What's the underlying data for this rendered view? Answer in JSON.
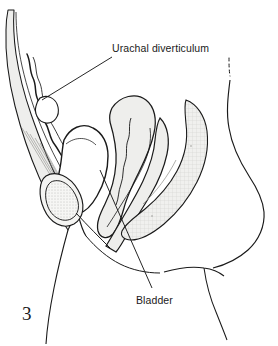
{
  "figure": {
    "number": "3",
    "kind": "medical-line-illustration",
    "view": "sagittal-section-female-pelvis",
    "background_color": "#ffffff",
    "ink_color": "#1a1a1a",
    "tissue_fill_color": "#eeeeec",
    "hatch_fill_color": "#e6e6e4"
  },
  "labels": [
    {
      "id": "urachal",
      "text": "Urachal diverticulum",
      "leader": {
        "from_x": 112,
        "from_y": 57,
        "to_x": 42,
        "to_y": 100
      }
    },
    {
      "id": "bladder",
      "text": "Bladder",
      "leader": {
        "from_x": 152,
        "from_y": 288,
        "to_x": 100,
        "to_y": 170
      }
    }
  ],
  "structures": [
    {
      "name": "anterior-abdominal-wall",
      "fill": "#eeeeec"
    },
    {
      "name": "urachal-tract",
      "fill": "none"
    },
    {
      "name": "urinary-bladder",
      "fill": "#ffffff"
    },
    {
      "name": "pubic-symphysis",
      "fill": "#f2f2f0"
    },
    {
      "name": "uterus",
      "fill": "#eeeeec"
    },
    {
      "name": "rectum",
      "fill": "#eeeeec"
    },
    {
      "name": "sacrum-coccyx",
      "fill": "#e6e6e4"
    },
    {
      "name": "body-contour-back",
      "fill": "none"
    },
    {
      "name": "thigh-contour",
      "fill": "none"
    }
  ]
}
